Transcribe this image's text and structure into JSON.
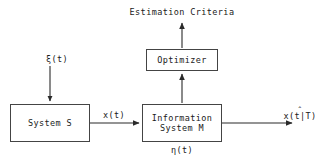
{
  "diagram": {
    "background_color": "#ffffff",
    "line_color": "#444444",
    "text_color": "#1a1a1a",
    "boxes": [
      {
        "id": "system_s",
        "label": "System S"
      },
      {
        "id": "info_sys",
        "label_line1": "Information",
        "label_line2": "System M"
      },
      {
        "id": "optimizer",
        "label": "Optimizer"
      }
    ],
    "labels": {
      "estimation_criteria": "Estimation Criteria",
      "input_noise": "ξ(t)",
      "signal": "x(t)",
      "measurement_noise": "η(t)",
      "estimate": "x(t|T)",
      "estimate_hat": "ˆ"
    },
    "arrows": [
      {
        "id": "xi-into-system-s",
        "from": "ξ(t)",
        "to": "System S",
        "direction": "down"
      },
      {
        "id": "system-s-to-info-sys",
        "from": "System S",
        "to": "Information System M",
        "direction": "right",
        "label": "x(t)"
      },
      {
        "id": "info-sys-to-optimizer",
        "from": "Information System M",
        "to": "Optimizer",
        "direction": "up"
      },
      {
        "id": "optimizer-to-criteria",
        "from": "Optimizer",
        "to": "Estimation Criteria",
        "direction": "up"
      },
      {
        "id": "info-sys-to-estimate",
        "from": "Information System M",
        "to": "x(t|T)",
        "direction": "right"
      }
    ]
  }
}
